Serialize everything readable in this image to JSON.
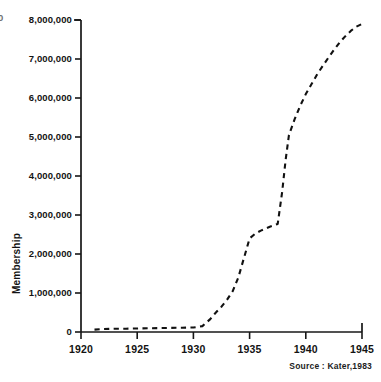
{
  "chart_data": {
    "type": "line",
    "title": "",
    "subtitle": "",
    "xlabel": "",
    "ylabel": "Membership",
    "xlim": [
      1920,
      1945
    ],
    "ylim": [
      0,
      8000000
    ],
    "grid": false,
    "legend": null,
    "line_style": "dashed",
    "line_color": "#111111",
    "series": [
      {
        "name": "Membership",
        "x": [
          1921.2,
          1922,
          1923,
          1924,
          1925,
          1926,
          1927,
          1928,
          1929,
          1930,
          1930.8,
          1931.5,
          1932,
          1932.5,
          1933,
          1933.5,
          1934,
          1934.5,
          1935,
          1935.5,
          1936,
          1936.8,
          1937.5,
          1937.9,
          1938.2,
          1938.5,
          1939,
          1939.5,
          1940,
          1940.5,
          1941,
          1941.5,
          1942,
          1942.5,
          1943,
          1943.5,
          1944,
          1944.5,
          1945
        ],
        "y": [
          60000,
          75000,
          85000,
          85000,
          90000,
          95000,
          100000,
          105000,
          110000,
          115000,
          150000,
          330000,
          500000,
          650000,
          830000,
          1050000,
          1400000,
          1900000,
          2400000,
          2520000,
          2600000,
          2700000,
          2770000,
          3600000,
          4400000,
          5050000,
          5450000,
          5800000,
          6100000,
          6350000,
          6600000,
          6820000,
          7030000,
          7230000,
          7420000,
          7580000,
          7720000,
          7830000,
          7900000
        ]
      }
    ],
    "x_ticks": [
      {
        "value": 1920,
        "label": "1920"
      },
      {
        "value": 1925,
        "label": "1925"
      },
      {
        "value": 1930,
        "label": "1930"
      },
      {
        "value": 1935,
        "label": "1935"
      },
      {
        "value": 1940,
        "label": "1940"
      },
      {
        "value": 1945,
        "label": "1945"
      }
    ],
    "y_ticks": [
      {
        "value": 0,
        "label": "0"
      },
      {
        "value": 1000000,
        "label": "1,000,000"
      },
      {
        "value": 2000000,
        "label": "2,000,000"
      },
      {
        "value": 3000000,
        "label": "3,000,000"
      },
      {
        "value": 4000000,
        "label": "4,000,000"
      },
      {
        "value": 5000000,
        "label": "5,000,000"
      },
      {
        "value": 6000000,
        "label": "6,000,000"
      },
      {
        "value": 7000000,
        "label": "7,000,000"
      },
      {
        "value": 8000000,
        "label": "8,000,000"
      }
    ],
    "annotations": [
      {
        "name": "source",
        "text": "Source : Kater,1983"
      }
    ]
  },
  "figure": {
    "source_note": "Source : Kater,1983",
    "y_axis_title": "Membership",
    "edge_fragment": "0",
    "background_color": "#ffffff",
    "axis_color": "#171717"
  }
}
